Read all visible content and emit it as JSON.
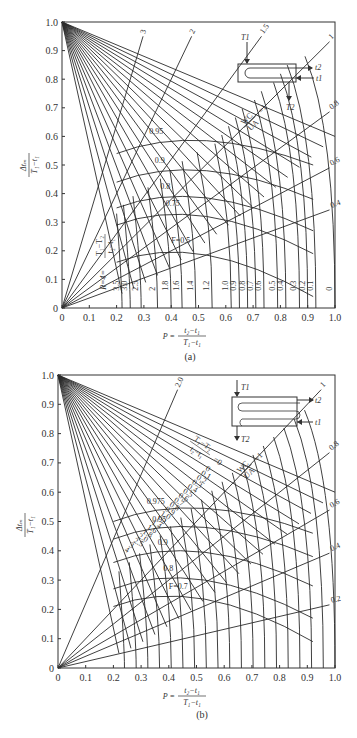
{
  "chart_data": [
    {
      "type": "line",
      "panel_label": "(a)",
      "title": "",
      "xlabel": "P = (t2 - t1)/(T1 - t1)",
      "ylabel": "Δtm/(T1 - t1)",
      "xlim": [
        0,
        1.0
      ],
      "ylim": [
        0,
        1.0
      ],
      "x_ticks": [
        "0",
        "0.1",
        "0.2",
        "0.3",
        "0.4",
        "0.5",
        "0.6",
        "0.7",
        "0.8",
        "0.9",
        "1.0"
      ],
      "y_ticks": [
        "0",
        "0.1",
        "0.2",
        "0.3",
        "0.4",
        "0.5",
        "0.6",
        "0.7",
        "0.8",
        "0.9",
        "1.0"
      ],
      "grid": false,
      "legend": null,
      "r_param_label": "R = (T1 - T2)/(t2 - t1) = 4",
      "r_curve_labels": [
        "3.5",
        "3.0",
        "2.5",
        "2",
        "1.8",
        "1.6",
        "1.4",
        "1.2",
        "1.0",
        "0.9",
        "0.8",
        "0.7",
        "0.6",
        "0.5",
        "0.4",
        "0.3",
        "0.2",
        "0.1",
        "0"
      ],
      "r_curve_p_end": [
        0.22,
        0.25,
        0.29,
        0.35,
        0.4,
        0.44,
        0.49,
        0.55,
        0.62,
        0.65,
        0.68,
        0.71,
        0.74,
        0.79,
        0.82,
        0.87,
        0.9,
        0.93,
        1.0
      ],
      "wcua_label": "WC/UA = 1",
      "wcua_lines": [
        "3",
        "2",
        "1.5",
        "1",
        "0.8",
        "0.6",
        "0.4"
      ],
      "f_curves": [
        {
          "label": "0.95",
          "y_peak": 0.6
        },
        {
          "label": "0.9",
          "y_peak": 0.5
        },
        {
          "label": "0.8",
          "y_peak": 0.41
        },
        {
          "label": "0.75",
          "y_peak": 0.35
        },
        {
          "label": "F=0.5",
          "y_peak": 0.22
        }
      ],
      "schematic_labels": {
        "T1": "T1",
        "T2": "T2",
        "t1": "t1",
        "t2": "t2"
      }
    },
    {
      "type": "line",
      "panel_label": "(b)",
      "title": "",
      "xlabel": "P = (t2 - t1)/(T1 - t1)",
      "ylabel": "Δtm/(T1 - t1)",
      "xlim": [
        0,
        1.0
      ],
      "ylim": [
        0,
        1.0
      ],
      "x_ticks": [
        "0",
        "0.1",
        "0.2",
        "0.3",
        "0.4",
        "0.5",
        "0.6",
        "0.7",
        "0.8",
        "0.9",
        "1.0"
      ],
      "y_ticks": [
        "0",
        "0.1",
        "0.2",
        "0.3",
        "0.4",
        "0.5",
        "0.6",
        "0.7",
        "0.8",
        "0.9",
        "1.0"
      ],
      "grid": false,
      "legend": null,
      "r_param_label": "(T1 - T2)/(t2 - t1) = 0",
      "r_curve_labels": [
        "0",
        "0.1",
        "0.2",
        "0.3",
        "0.4",
        "0.5",
        "0.6",
        "0.7",
        "0.8",
        "0.9",
        "1.0",
        "1.2",
        "1.4",
        "1.6",
        "1.8",
        "2.0",
        "2.5",
        "3",
        "4"
      ],
      "wcua_label": "WC/UA = 1",
      "wcua_lines": [
        "2.0",
        "1",
        "0.8",
        "0.6",
        "0.4",
        "0.2"
      ],
      "f_curves": [
        {
          "label": "0.975",
          "y_peak": 0.56
        },
        {
          "label": "0.95",
          "y_peak": 0.5
        },
        {
          "label": "0.9",
          "y_peak": 0.42
        },
        {
          "label": "0.8",
          "y_peak": 0.33
        },
        {
          "label": "F=0.7",
          "y_peak": 0.27
        }
      ],
      "schematic_labels": {
        "T1": "T1",
        "T2": "T2",
        "t1": "t1",
        "t2": "t2"
      }
    }
  ],
  "panels": {
    "a": {
      "caption": "(a)",
      "xlabel_prefix": "P =",
      "xlabel_num": "t₂−t₁",
      "xlabel_den": "T₁−t₁",
      "ylabel_num": "Δtₘ",
      "ylabel_den": "T₁−t₁",
      "r_label": "R=4=",
      "r_num": "T₁−T₂",
      "r_den": "t₂−t₁",
      "wc": "WC",
      "ua": "UA",
      "wc_eq": "=1"
    },
    "b": {
      "caption": "(b)",
      "xlabel_prefix": "P =",
      "xlabel_num": "t₂−t₁",
      "xlabel_den": "T₁−t₁",
      "ylabel_num": "Δtₘ",
      "ylabel_den": "T₁−t₁",
      "r_num": "T₁−T₂",
      "r_den": "t₂−t₁",
      "r_eq": "=0",
      "wc": "WC",
      "ua": "UA",
      "wc_eq": "=1"
    }
  }
}
